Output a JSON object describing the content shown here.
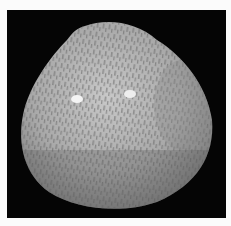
{
  "image": {
    "subject": "bivalve seashell",
    "description": "Grey speckled clam shell with radial ribbing and dark mottled pattern on black background",
    "colors": {
      "background": "#050505",
      "border": "#fbfbfb",
      "shell_light": "#c9c9c9",
      "shell_mid": "#9a9a9a",
      "shell_dark": "#5e5e5e",
      "highlight": "#f4f4f4"
    }
  }
}
